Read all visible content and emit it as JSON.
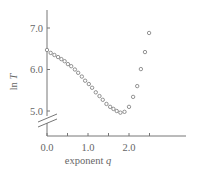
{
  "chart_data": {
    "type": "scatter",
    "title": "",
    "xlabel": "exponent q",
    "xlabel_parts": {
      "text": "exponent ",
      "var": "q"
    },
    "ylabel": "ln T",
    "ylabel_parts": {
      "text": "ln ",
      "var": "T"
    },
    "xlim": [
      0.0,
      3.4
    ],
    "ylim": [
      4.45,
      7.45
    ],
    "x_ticks": [
      0.0,
      0.5,
      1.0,
      1.5,
      2.0,
      2.5
    ],
    "x_tick_labels": [
      {
        "value": 0.0,
        "label": "0.0"
      },
      {
        "value": 1.0,
        "label": "1.0"
      },
      {
        "value": 2.0,
        "label": "2.0"
      }
    ],
    "y_ticks": [
      5.0,
      6.0,
      7.0
    ],
    "y_tick_labels": [
      {
        "value": 5.0,
        "label": "5.0"
      },
      {
        "value": 6.0,
        "label": "6.0"
      },
      {
        "value": 7.0,
        "label": "7.0"
      }
    ],
    "y_axis_break": true,
    "grid": false,
    "legend": null,
    "marker": "open-circle",
    "colors": {
      "axis": "#777777",
      "marker": "#777777",
      "text": "#666666"
    },
    "series": [
      {
        "name": "ln T vs q",
        "x": [
          0.0,
          0.09,
          0.18,
          0.27,
          0.35,
          0.43,
          0.51,
          0.59,
          0.68,
          0.76,
          0.85,
          0.93,
          1.02,
          1.1,
          1.19,
          1.28,
          1.36,
          1.45,
          1.54,
          1.62,
          1.7,
          1.79,
          1.89,
          2.0,
          2.1,
          2.2,
          2.29,
          2.39,
          2.49
        ],
        "y": [
          6.47,
          6.4,
          6.35,
          6.3,
          6.25,
          6.2,
          6.13,
          6.08,
          6.0,
          5.92,
          5.83,
          5.73,
          5.65,
          5.56,
          5.45,
          5.36,
          5.27,
          5.17,
          5.1,
          5.05,
          5.0,
          4.96,
          4.98,
          5.1,
          5.34,
          5.6,
          6.01,
          6.42,
          6.88
        ]
      }
    ]
  }
}
